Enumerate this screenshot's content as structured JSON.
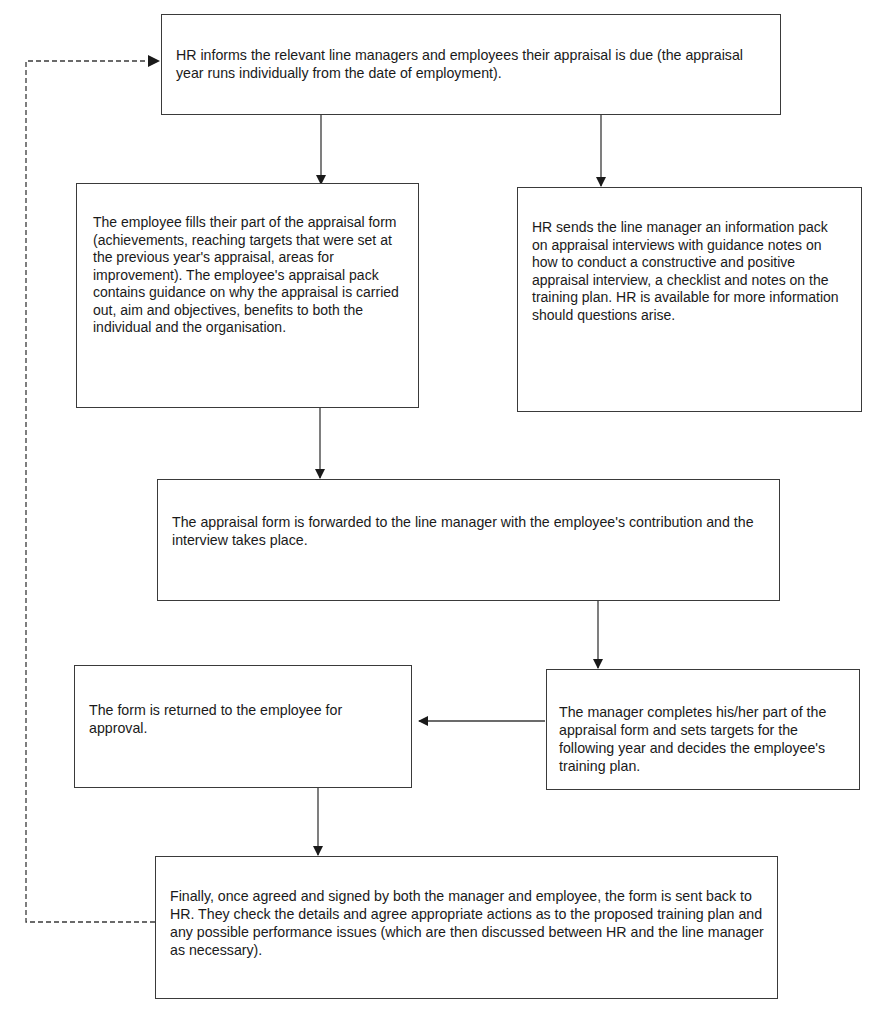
{
  "diagram": {
    "type": "flowchart",
    "steps": [
      {
        "id": "step-1",
        "text": "HR informs the relevant line managers and employees their appraisal is due (the appraisal year runs individually from the date of employment)."
      },
      {
        "id": "step-2a",
        "text": "The employee fills their part of the appraisal form (achievements, reaching targets that were set at the previous year's appraisal, areas for improvement). The employee's appraisal pack contains guidance on why the appraisal is carried out, aim and objectives, benefits to both the individual and the organisation."
      },
      {
        "id": "step-2b",
        "text": "HR sends the line manager an information pack on appraisal interviews with guidance notes on how to conduct a constructive and positive appraisal interview, a checklist and notes on the training plan. HR is available for more information should questions arise."
      },
      {
        "id": "step-3",
        "text": "The appraisal form is forwarded to the line manager with the employee's contribution and the interview takes place."
      },
      {
        "id": "step-4",
        "text": "The manager completes his/her part of the appraisal form and sets targets for the following year and decides the employee's training plan."
      },
      {
        "id": "step-5",
        "text": "The form is returned to the employee for approval."
      },
      {
        "id": "step-6",
        "text": "Finally, once agreed and signed by both the manager and employee, the form is sent back to HR. They check the details and agree appropriate actions as to the proposed training plan and any possible performance issues (which are then discussed between HR and the line manager as necessary)."
      }
    ],
    "connections": [
      {
        "from": "step-1",
        "to": "step-2a",
        "style": "solid"
      },
      {
        "from": "step-1",
        "to": "step-2b",
        "style": "solid"
      },
      {
        "from": "step-2a",
        "to": "step-3",
        "style": "solid"
      },
      {
        "from": "step-3",
        "to": "step-4",
        "style": "solid"
      },
      {
        "from": "step-4",
        "to": "step-5",
        "style": "solid"
      },
      {
        "from": "step-5",
        "to": "step-6",
        "style": "solid"
      },
      {
        "from": "step-6",
        "to": "step-1",
        "style": "dashed"
      }
    ],
    "colors": {
      "line": "#3a3a3a",
      "text": "#1a1a1a",
      "background": "#ffffff"
    }
  }
}
